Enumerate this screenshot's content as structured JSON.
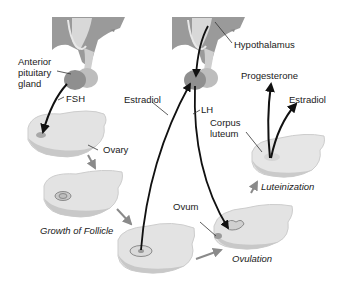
{
  "diagram": {
    "type": "hormonal regulation of the ovarian cycle",
    "labels": {
      "anterior_pituitary": [
        "Anterior",
        "pituitary",
        "gland"
      ],
      "hypothalamus": "Hypothalamus",
      "fsh": "FSH",
      "lh": "LH",
      "estradiol_left": "Estradiol",
      "estradiol_right": "Estradiol",
      "progesterone": "Progesterone",
      "corpus_luteum": [
        "Corpus",
        "luteum"
      ],
      "ovary": "Ovary",
      "ovum": "Ovum"
    },
    "stages": {
      "growth": "Growth of Follicle",
      "ovulation": "Ovulation",
      "luteinization": "Luteinization"
    },
    "colors": {
      "brain": "#8c8c8c",
      "brain_light": "#c9c9c9",
      "pituitary": "#9a9a9a",
      "ovary_fill": "#e3e3e3",
      "ovary_edge": "#c4c4c4",
      "arrow": "#111111",
      "stage_arrow": "#8a8a8a"
    }
  }
}
